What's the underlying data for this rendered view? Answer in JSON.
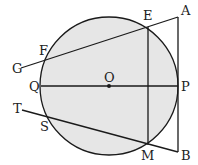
{
  "diagram": {
    "type": "circle-geometry",
    "circle": {
      "center": "O",
      "cx": 109,
      "cy": 86,
      "r": 69,
      "fill": "#e6e6e6",
      "stroke": "#1a1a1a"
    },
    "points": {
      "O": {
        "x": 109,
        "y": 86,
        "label": "O"
      },
      "Q": {
        "x": 41,
        "y": 86,
        "label": "Q"
      },
      "P": {
        "x": 178,
        "y": 86,
        "label": "P"
      },
      "E": {
        "x": 148,
        "y": 27,
        "label": "E"
      },
      "M": {
        "x": 148,
        "y": 145,
        "label": "M"
      },
      "A": {
        "x": 178,
        "y": 17,
        "label": "A"
      },
      "B": {
        "x": 178,
        "y": 152,
        "label": "B"
      },
      "F": {
        "x": 45,
        "y": 60,
        "label": "F"
      },
      "G": {
        "x": 21,
        "y": 68,
        "label": "G"
      },
      "S": {
        "x": 48,
        "y": 118,
        "label": "S"
      },
      "T": {
        "x": 22,
        "y": 110,
        "label": "T"
      }
    },
    "segments": [
      {
        "name": "diameter-QP",
        "from": "Q",
        "to": "P"
      },
      {
        "name": "chord-EM",
        "from": "E",
        "to": "M"
      },
      {
        "name": "tangent-AB",
        "from": "A",
        "to": "B"
      },
      {
        "name": "secant-AG",
        "from": "A",
        "to": "G"
      },
      {
        "name": "secant-BT",
        "from": "B",
        "to": "T"
      }
    ]
  }
}
